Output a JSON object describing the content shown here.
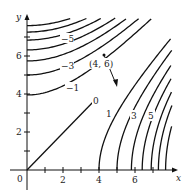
{
  "figure": {
    "type": "contour-map",
    "axes": {
      "x_label": "x",
      "y_label": "y",
      "x_ticks": [
        "2",
        "4",
        "6"
      ],
      "y_ticks": [
        "2",
        "4",
        "6"
      ],
      "origin_label": "0"
    },
    "contour_labels": {
      "neg5": "−5",
      "neg3": "−3",
      "neg1": "−1",
      "zero": "0",
      "pos1": "1",
      "pos3": "3",
      "pos5": "5"
    },
    "point_label": "(4, 6)",
    "colors": {
      "line": "#111111",
      "background": "#ffffff"
    }
  }
}
